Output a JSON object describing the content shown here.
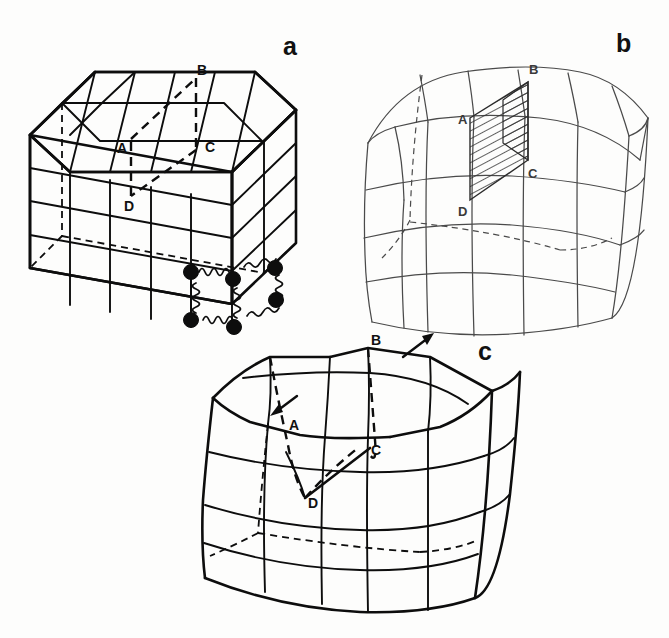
{
  "figure": {
    "background_color": "#fdfdfc",
    "ink_color": "#0d0d0d",
    "light_ink_color": "#4a4a4a"
  },
  "panels": [
    {
      "id": "a",
      "label": "a",
      "label_x": 283,
      "label_y": 55,
      "caption_role": "undeformed-block-with-springs",
      "line_style": "heavy-black",
      "fault_plane_style": "dashed-outline",
      "has_springs": true,
      "has_hatched_plane": false,
      "has_slip_arrows": false,
      "node_labels": [
        {
          "text": "A",
          "x": 121,
          "y": 148
        },
        {
          "text": "B",
          "x": 201,
          "y": 82
        },
        {
          "text": "C",
          "x": 208,
          "y": 150
        },
        {
          "text": "D",
          "x": 128,
          "y": 206
        }
      ],
      "grid": {
        "columns": 4,
        "rows": 4,
        "depth_cells": 2
      }
    },
    {
      "id": "b",
      "label": "b",
      "label_x": 620,
      "label_y": 48,
      "caption_role": "deformed-block-with-shaded-fault-plane",
      "line_style": "thin-gray",
      "fault_plane_style": "hatched-filled",
      "has_springs": false,
      "has_hatched_plane": true,
      "has_slip_arrows": false,
      "node_labels": [
        {
          "text": "B",
          "x": 534,
          "y": 75
        },
        {
          "text": "A",
          "x": 463,
          "y": 122
        },
        {
          "text": "C",
          "x": 531,
          "y": 173
        },
        {
          "text": "D",
          "x": 463,
          "y": 212
        }
      ],
      "grid": {
        "columns": 4,
        "rows": 4,
        "depth_cells": 2
      }
    },
    {
      "id": "c",
      "label": "c",
      "label_x": 483,
      "label_y": 355,
      "caption_role": "deformed-block-with-slip-on-fault",
      "line_style": "heavy-black",
      "fault_plane_style": "dashed-outline-collapsed",
      "has_springs": false,
      "has_hatched_plane": false,
      "has_slip_arrows": true,
      "node_labels": [
        {
          "text": "B",
          "x": 376,
          "y": 348
        },
        {
          "text": "A",
          "x": 293,
          "y": 425
        },
        {
          "text": "C",
          "x": 374,
          "y": 450
        },
        {
          "text": "D",
          "x": 313,
          "y": 502
        }
      ],
      "grid": {
        "columns": 4,
        "rows": 4,
        "depth_cells": 2
      }
    }
  ],
  "annotations": {
    "slip_arrow_outer": {
      "name": "slip-direction-arrow-up-right",
      "direction": "up-right",
      "tail_x": 405,
      "tail_y": 355,
      "tip_x": 430,
      "tip_y": 337
    },
    "slip_arrow_inner": {
      "name": "slip-direction-arrow-down-left",
      "direction": "down-left",
      "tail_x": 295,
      "tail_y": 397,
      "tip_x": 273,
      "tip_y": 413
    }
  },
  "spring_elements": {
    "count": 6,
    "node_count": 6,
    "node_radius": 7,
    "coil_turns": 5,
    "description": "Coil springs joining filled circular nodes along the lower right corner edges of panel a."
  }
}
